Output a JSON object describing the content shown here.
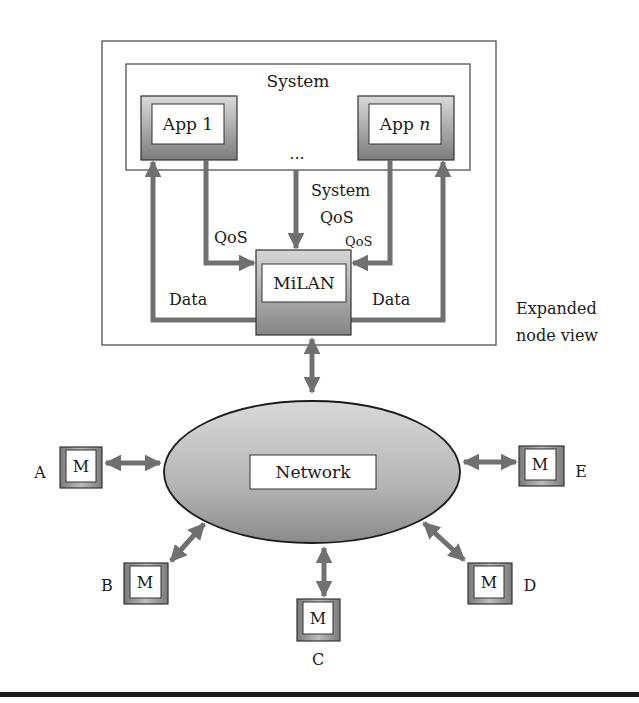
{
  "diagram": {
    "expanded_label_line1": "Expanded",
    "expanded_label_line2": "node view",
    "system": {
      "label": "System",
      "ellipsis": "...",
      "apps": [
        {
          "label_prefix": "App ",
          "label_suffix": "1"
        },
        {
          "label_prefix": "App ",
          "label_suffix": "n"
        }
      ]
    },
    "milan": {
      "label": "MiLAN"
    },
    "edges": {
      "qos_left": "QoS",
      "qos_right": "QoS",
      "system_qos_line1": "System",
      "system_qos_line2": "QoS",
      "data_left": "Data",
      "data_right": "Data"
    },
    "network": {
      "label": "Network"
    },
    "nodes": [
      {
        "id": "A",
        "inner": "M"
      },
      {
        "id": "B",
        "inner": "M"
      },
      {
        "id": "C",
        "inner": "M"
      },
      {
        "id": "D",
        "inner": "M"
      },
      {
        "id": "E",
        "inner": "M"
      }
    ],
    "colors": {
      "arrow": "#707070",
      "border": "#333333",
      "box_gradient_top": "#d8d8d8",
      "box_gradient_bottom": "#7a7a7a",
      "ellipse_top": "#d4d4d4",
      "ellipse_bottom": "#8c8c8c"
    }
  }
}
